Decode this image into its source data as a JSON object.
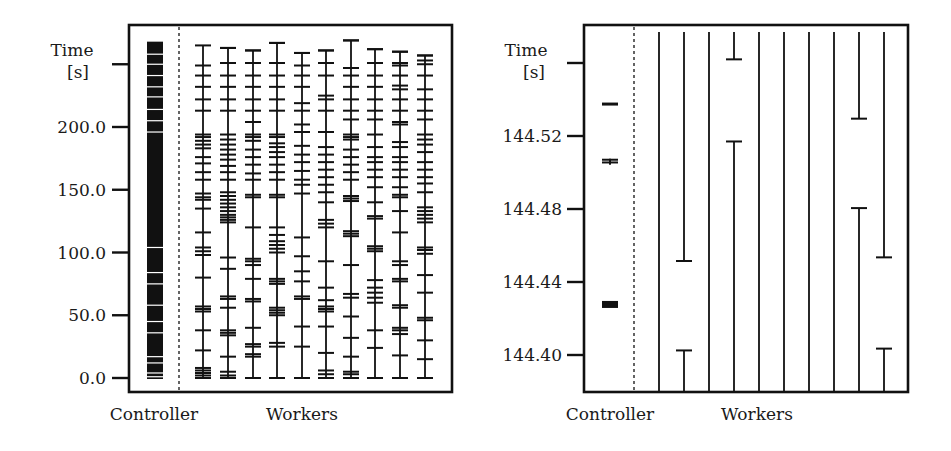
{
  "chart_data": [
    {
      "type": "timeline",
      "title": "",
      "ylabel": "Time [s]",
      "ylabel_line1": "Time",
      "ylabel_line2": "[s]",
      "xlabel_controller": "Controller",
      "xlabel_workers": "Workers",
      "yticks": [
        0.0,
        50.0,
        100.0,
        150.0,
        200.0,
        250.0
      ],
      "ytick_labels": [
        "0.0",
        "50.0",
        "100.0",
        "150.0",
        "200.0",
        ""
      ],
      "ylim": [
        -8,
        284
      ],
      "grid": false,
      "controller": {
        "type": "dense-bar",
        "span": [
          0,
          268
        ],
        "gaps": [
          1,
          4,
          12,
          17,
          36,
          45,
          58,
          75,
          84,
          104,
          196,
          205,
          214,
          224,
          232,
          241,
          250,
          258
        ]
      },
      "workers": [
        {
          "name": "W1",
          "start": 0,
          "end": 265,
          "ticks": [
            0,
            2,
            4,
            6,
            8,
            22,
            38,
            53,
            55,
            57,
            80,
            98,
            101,
            104,
            116,
            135,
            142,
            144,
            147,
            158,
            164,
            171,
            176,
            183,
            186,
            189,
            192,
            194,
            213,
            222,
            232,
            241,
            249
          ]
        },
        {
          "name": "W2",
          "start": 0,
          "end": 263,
          "ticks": [
            0,
            2,
            5,
            17,
            34,
            36,
            38,
            56,
            63,
            65,
            87,
            96,
            124,
            126,
            128,
            130,
            133,
            136,
            139,
            142,
            145,
            148,
            158,
            164,
            169,
            174,
            178,
            182,
            186,
            190,
            194,
            213,
            222,
            232,
            241,
            251,
            263
          ]
        },
        {
          "name": "W3",
          "start": 0,
          "end": 261,
          "ticks": [
            0,
            17,
            19,
            25,
            27,
            40,
            61,
            63,
            79,
            90,
            93,
            95,
            120,
            144,
            146,
            158,
            163,
            170,
            176,
            182,
            189,
            192,
            194,
            204,
            213,
            222,
            232,
            241,
            251,
            261
          ]
        },
        {
          "name": "W4",
          "start": 0,
          "end": 267,
          "ticks": [
            0,
            25,
            28,
            50,
            52,
            54,
            56,
            75,
            77,
            79,
            100,
            103,
            106,
            109,
            114,
            120,
            144,
            146,
            158,
            164,
            170,
            176,
            180,
            184,
            187,
            192,
            194,
            213,
            222,
            232,
            241,
            251,
            267
          ]
        },
        {
          "name": "W5",
          "start": 0,
          "end": 259,
          "ticks": [
            0,
            25,
            41,
            63,
            65,
            77,
            85,
            97,
            112,
            147,
            154,
            158,
            165,
            172,
            178,
            185,
            196,
            202,
            213,
            219,
            232,
            241,
            249,
            259
          ]
        },
        {
          "name": "W6",
          "start": 0,
          "end": 261,
          "ticks": [
            0,
            3,
            6,
            20,
            41,
            53,
            55,
            57,
            62,
            72,
            93,
            120,
            123,
            126,
            140,
            148,
            154,
            160,
            166,
            172,
            178,
            184,
            196,
            213,
            222,
            225,
            241,
            251,
            261
          ]
        },
        {
          "name": "W7",
          "start": 0,
          "end": 269,
          "ticks": [
            0,
            3,
            5,
            17,
            32,
            49,
            64,
            67,
            90,
            113,
            115,
            117,
            141,
            143,
            145,
            158,
            164,
            170,
            176,
            182,
            190,
            192,
            194,
            206,
            213,
            222,
            232,
            241,
            247,
            269
          ]
        },
        {
          "name": "W8",
          "start": 0,
          "end": 262,
          "ticks": [
            0,
            24,
            38,
            60,
            64,
            68,
            72,
            78,
            101,
            103,
            105,
            127,
            129,
            140,
            152,
            160,
            166,
            172,
            176,
            184,
            194,
            206,
            213,
            222,
            232,
            241,
            251,
            262
          ]
        },
        {
          "name": "W9",
          "start": 0,
          "end": 260,
          "ticks": [
            0,
            18,
            35,
            38,
            40,
            56,
            58,
            77,
            79,
            90,
            93,
            116,
            133,
            144,
            146,
            152,
            160,
            166,
            172,
            176,
            184,
            188,
            202,
            204,
            213,
            222,
            230,
            233,
            241,
            249,
            251,
            260
          ]
        },
        {
          "name": "W10",
          "start": 0,
          "end": 257,
          "ticks": [
            0,
            15,
            30,
            46,
            48,
            68,
            82,
            99,
            102,
            104,
            124,
            127,
            130,
            133,
            136,
            148,
            155,
            160,
            166,
            172,
            180,
            186,
            190,
            194,
            206,
            213,
            222,
            230,
            241,
            250,
            253,
            257
          ]
        }
      ]
    },
    {
      "type": "timeline",
      "title": "",
      "ylabel": "Time [s]",
      "ylabel_line1": "Time",
      "ylabel_line2": "[s]",
      "xlabel_controller": "Controller",
      "xlabel_workers": "Workers",
      "yticks": [
        144.4,
        144.44,
        144.48,
        144.52,
        144.56
      ],
      "ytick_labels": [
        "144.40",
        "144.44",
        "144.48",
        "144.52",
        ""
      ],
      "ylim": [
        144.37,
        144.577
      ],
      "grid": false,
      "controller": {
        "type": "marks",
        "marks": [
          {
            "t": 144.5375,
            "kind": "dash"
          },
          {
            "t": 144.5055,
            "kind": "double-dash"
          },
          {
            "t": 144.507,
            "kind": "double-dash-top"
          },
          {
            "t": 144.4277,
            "kind": "block"
          }
        ]
      },
      "workers": [
        {
          "name": "W1",
          "segments": [
            {
              "from": 144.37,
              "to": 144.577
            }
          ],
          "ticks": []
        },
        {
          "name": "W2",
          "segments": [
            {
              "from": 144.37,
              "to": 144.4025
            },
            {
              "from": 144.4515,
              "to": 144.577
            }
          ],
          "ticks": [
            144.4025,
            144.4515
          ]
        },
        {
          "name": "W3",
          "segments": [
            {
              "from": 144.37,
              "to": 144.577
            }
          ],
          "ticks": []
        },
        {
          "name": "W4",
          "segments": [
            {
              "from": 144.37,
              "to": 144.517
            },
            {
              "from": 144.562,
              "to": 144.577
            }
          ],
          "ticks": [
            144.517,
            144.562
          ]
        },
        {
          "name": "W5",
          "segments": [
            {
              "from": 144.37,
              "to": 144.577
            }
          ],
          "ticks": []
        },
        {
          "name": "W6",
          "segments": [
            {
              "from": 144.37,
              "to": 144.577
            }
          ],
          "ticks": []
        },
        {
          "name": "W7",
          "segments": [
            {
              "from": 144.37,
              "to": 144.577
            }
          ],
          "ticks": []
        },
        {
          "name": "W8",
          "segments": [
            {
              "from": 144.37,
              "to": 144.577
            }
          ],
          "ticks": []
        },
        {
          "name": "W9",
          "segments": [
            {
              "from": 144.37,
              "to": 144.4805
            },
            {
              "from": 144.5295,
              "to": 144.577
            }
          ],
          "ticks": [
            144.4805,
            144.5295
          ]
        },
        {
          "name": "W10",
          "segments": [
            {
              "from": 144.37,
              "to": 144.4035
            },
            {
              "from": 144.4535,
              "to": 144.577
            }
          ],
          "ticks": [
            144.4035,
            144.4535
          ]
        }
      ]
    }
  ],
  "panels": {
    "left": {
      "ylabel_line1": "Time",
      "ylabel_line2": "[s]",
      "ytick_labels": [
        "0.0",
        "50.0",
        "100.0",
        "150.0",
        "200.0"
      ],
      "xlabel_controller": "Controller",
      "xlabel_workers": "Workers"
    },
    "right": {
      "ylabel_line1": "Time",
      "ylabel_line2": "[s]",
      "ytick_labels": [
        "144.40",
        "144.44",
        "144.48",
        "144.52"
      ],
      "xlabel_controller": "Controller",
      "xlabel_workers": "Workers"
    }
  },
  "colors": {
    "ink": "#111111",
    "background": "#ffffff"
  }
}
